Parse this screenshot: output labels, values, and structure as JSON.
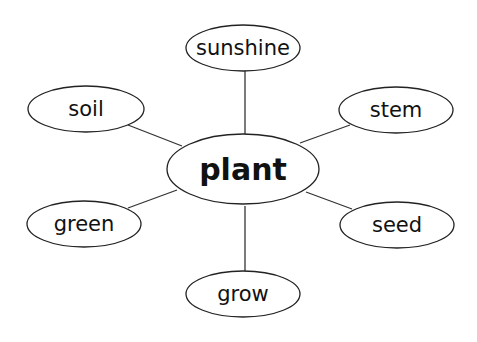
{
  "diagram": {
    "type": "word-web",
    "center": {
      "label": "plant",
      "cx": 243,
      "cy": 169,
      "rx": 76,
      "ry": 35
    },
    "nodes": [
      {
        "label": "sunshine",
        "cx": 243,
        "cy": 48,
        "rx": 57,
        "ry": 23,
        "edge": [
          245,
          71,
          245,
          134
        ]
      },
      {
        "label": "soil",
        "cx": 86,
        "cy": 109,
        "rx": 58,
        "ry": 23,
        "edge": [
          128,
          125,
          182,
          146
        ]
      },
      {
        "label": "stem",
        "cx": 396,
        "cy": 110,
        "rx": 57,
        "ry": 23,
        "edge": [
          350,
          125,
          300,
          143
        ]
      },
      {
        "label": "green",
        "cx": 84,
        "cy": 224,
        "rx": 57,
        "ry": 23,
        "edge": [
          128,
          208,
          177,
          190
        ]
      },
      {
        "label": "seed",
        "cx": 397,
        "cy": 225,
        "rx": 57,
        "ry": 23,
        "edge": [
          352,
          209,
          306,
          192
        ]
      },
      {
        "label": "grow",
        "cx": 243,
        "cy": 294,
        "rx": 57,
        "ry": 23,
        "edge": [
          245,
          206,
          245,
          271
        ]
      }
    ]
  }
}
